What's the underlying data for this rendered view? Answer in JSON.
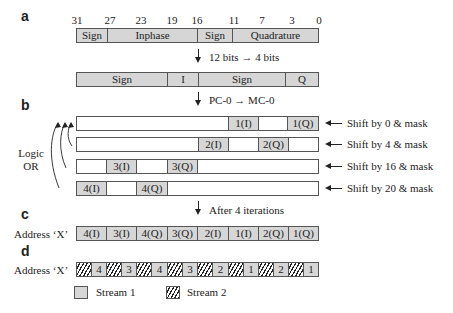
{
  "panels": {
    "a": "a",
    "b": "b",
    "c": "c",
    "d": "d"
  },
  "panel_a": {
    "bit_ticks": [
      "31",
      "27",
      "23",
      "19",
      "16",
      "11",
      "7",
      "3",
      "0"
    ],
    "word_fields": [
      "Sign",
      "Inphase",
      "Sign",
      "Quadrature"
    ],
    "step1_label": "12 bits → 4 bits",
    "compressed_fields": [
      "Sign",
      "I",
      "Sign",
      "Q"
    ],
    "step2_label": "PC-0 → MC-0"
  },
  "panel_b": {
    "or_label_line1": "Logic",
    "or_label_line2": "OR",
    "rows": [
      {
        "cells": [
          "",
          "1(I)",
          "",
          "1(Q)"
        ],
        "shift_label": "Shift by 0 & mask"
      },
      {
        "cells": [
          "",
          "2(I)",
          "",
          "2(Q)",
          ""
        ],
        "shift_label": "Shift by 4 & mask"
      },
      {
        "cells": [
          "",
          "3(I)",
          "",
          "3(Q)",
          ""
        ],
        "shift_label": "Shift by 16 & mask"
      },
      {
        "cells": [
          "4(I)",
          "",
          "4(Q)",
          ""
        ],
        "shift_label": "Shift by 20 & mask"
      }
    ],
    "step_label": "After 4 iterations"
  },
  "panel_c": {
    "row_label": "Address ‘X’",
    "cells": [
      "4(I)",
      "3(I)",
      "4(Q)",
      "3(Q)",
      "2(I)",
      "1(I)",
      "2(Q)",
      "1(Q)"
    ]
  },
  "panel_d": {
    "row_label": "Address ‘X’",
    "cells": [
      "4",
      "4",
      "3",
      "3",
      "4",
      "4",
      "3",
      "3",
      "2",
      "2",
      "1",
      "1",
      "2",
      "2",
      "1",
      "1"
    ],
    "legend": [
      {
        "label": "Stream 1",
        "pattern": "solid-gray"
      },
      {
        "label": "Stream 2",
        "pattern": "hatched"
      }
    ]
  },
  "colors": {
    "fill_gray": "#d6d6d6",
    "border": "#555555",
    "text": "#222222"
  }
}
